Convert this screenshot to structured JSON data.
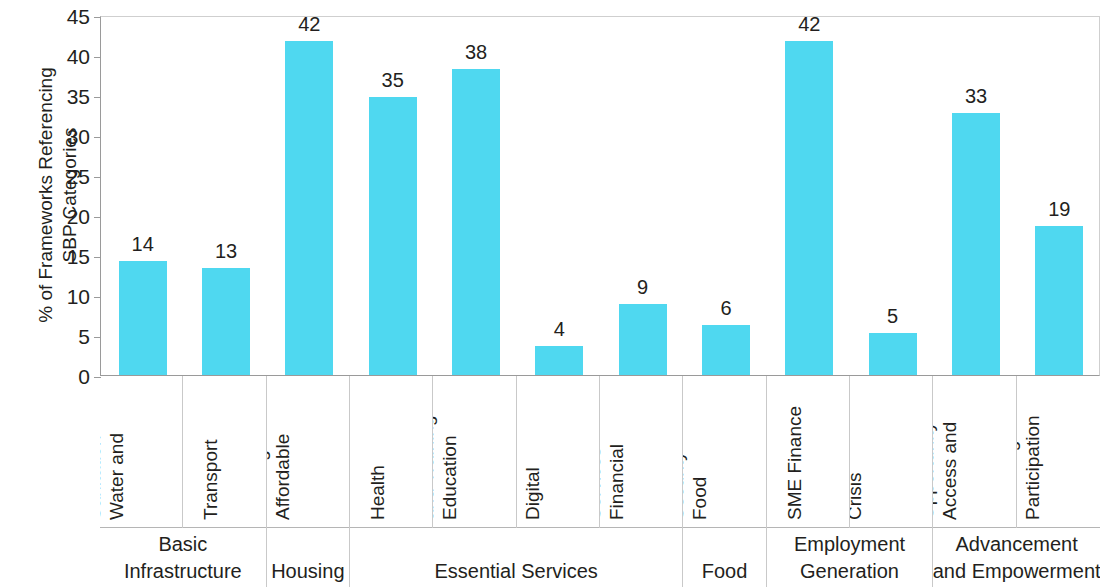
{
  "chart_data": {
    "type": "bar",
    "title": "",
    "xlabel": "",
    "ylabel": "% of Frameworks Referencing SBP Categories",
    "ylabel_lines": [
      "% of Frameworks Referencing",
      "SBP Categories"
    ],
    "ylim": [
      0,
      45
    ],
    "yticks": [
      0,
      5,
      10,
      15,
      20,
      25,
      30,
      35,
      40,
      45
    ],
    "ytick_labels": [
      "0",
      "5",
      "10",
      "15",
      "20",
      "25",
      "30",
      "35",
      "40",
      "45"
    ],
    "grid": false,
    "legend": "none",
    "bar_color": "#4fd8f0",
    "categories": [
      "Water and Sanitation",
      "Transport",
      "Affordable Housing",
      "Health",
      "Education and Training",
      "Digital Access",
      "Financial Services",
      "Food Security",
      "SME Finance",
      "Crisis Unemployment Alleviation",
      "Access and Opportunity",
      "Participation and Integration"
    ],
    "category_lines": [
      [
        "Water and",
        "Sanitation"
      ],
      [
        "Transport"
      ],
      [
        "Affordable",
        "Housing"
      ],
      [
        "Health"
      ],
      [
        "Education",
        "and Training"
      ],
      [
        "Digital",
        "Access"
      ],
      [
        "Financial",
        "Services"
      ],
      [
        "Food",
        "Security"
      ],
      [
        "SME Finance"
      ],
      [
        "Crisis",
        "Unemployment",
        "Alleviation"
      ],
      [
        "Access and",
        "Opportunity"
      ],
      [
        "Participation",
        "and Integration"
      ]
    ],
    "values": [
      14,
      13,
      42,
      35,
      38,
      4,
      9,
      6,
      42,
      5,
      33,
      19
    ],
    "value_labels": [
      "14",
      "13",
      "42",
      "35",
      "38",
      "4",
      "9",
      "6",
      "42",
      "5",
      "33",
      "19"
    ],
    "bar_pixel_heights": [
      14.3,
      13.4,
      41.8,
      34.7,
      38.2,
      3.6,
      8.9,
      6.2,
      41.7,
      5.2,
      32.7,
      18.6
    ],
    "groups": [
      {
        "label": "Basic Infrastructure",
        "lines": [
          "Basic",
          "Infrastructure"
        ],
        "span": 2
      },
      {
        "label": "Housing",
        "lines": [
          "Housing"
        ],
        "span": 1
      },
      {
        "label": "Essential Services",
        "lines": [
          "Essential Services"
        ],
        "span": 4
      },
      {
        "label": "Food",
        "lines": [
          "Food"
        ],
        "span": 1
      },
      {
        "label": "Employment Generation",
        "lines": [
          "Employment",
          "Generation"
        ],
        "span": 2
      },
      {
        "label": "Advancement and Empowerment",
        "lines": [
          "Advancement",
          "and Empowerment"
        ],
        "span": 2
      }
    ]
  }
}
